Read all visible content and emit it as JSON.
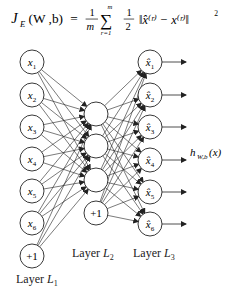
{
  "formula": {
    "lhs": "J",
    "lhs_sub": "E",
    "args": "(W ,b)",
    "eq": "=",
    "frac1_num": "1",
    "frac1_den": "m",
    "sum_top": "m",
    "sum_bottom": "r=1",
    "frac2_num": "1",
    "frac2_den": "2",
    "body": "‖x̂⁽ʳ⁾ − x⁽ʳ⁾‖",
    "power": "2"
  },
  "input_layer": {
    "nodes": [
      "x1",
      "x2",
      "x3",
      "x4",
      "x5",
      "x6",
      "+1"
    ],
    "label": "Layer",
    "label_var": "L",
    "label_sub": "1"
  },
  "hidden_layer": {
    "nodes": [
      "",
      "",
      "",
      "+1"
    ],
    "label": "Layer",
    "label_var": "L",
    "label_sub": "2"
  },
  "output_layer": {
    "nodes": [
      "x̂1",
      "x̂2",
      "x̂3",
      "x̂4",
      "x̂5",
      "x̂6"
    ],
    "label": "Layer",
    "label_var": "L",
    "label_sub": "3"
  },
  "output_function": {
    "name": "h",
    "sub": "W,b",
    "arg": "(x)"
  },
  "colors": {
    "stroke": "#222222",
    "background": "#ffffff"
  }
}
